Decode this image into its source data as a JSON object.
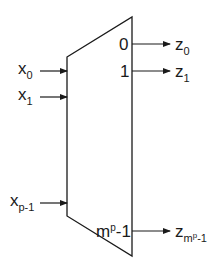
{
  "diagram": {
    "type": "multiplexer/decoder block",
    "inputs": [
      {
        "base": "x",
        "sub": "0"
      },
      {
        "base": "x",
        "sub": "1"
      },
      {
        "base": "x",
        "sub": "p-1"
      }
    ],
    "output_ports": [
      "0",
      "1",
      "m",
      "-1"
    ],
    "output_port_last": {
      "base": "m",
      "sup": "p",
      "tail": "-1"
    },
    "outputs": [
      {
        "base": "z",
        "sub": "0"
      },
      {
        "base": "z",
        "sub": "1"
      },
      {
        "base": "z",
        "sub_base": "m",
        "sub_sup": "p",
        "sub_tail": "-1"
      }
    ],
    "colors": {
      "line": "#1a1a1a",
      "background": "#ffffff"
    }
  }
}
